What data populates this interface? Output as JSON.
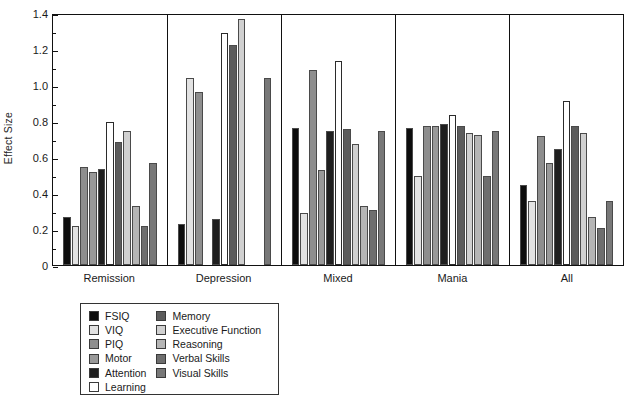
{
  "figure": {
    "background": "#ffffff",
    "axis_color": "#111111"
  },
  "chart_data": {
    "type": "bar",
    "title": "",
    "xlabel": "",
    "ylabel": "Effect Size",
    "ylim": [
      0,
      1.4
    ],
    "ytick_labels": [
      "0",
      "0.2",
      "0.4",
      "0.6",
      "0.8",
      "1.0",
      "1.2",
      "1.4"
    ],
    "ytick_values": [
      0,
      0.2,
      0.4,
      0.6,
      0.8,
      1.0,
      1.2,
      1.4
    ],
    "grid": false,
    "legend_position": "below-left",
    "categories": [
      "Remission",
      "Depression",
      "Mixed",
      "Mania",
      "All"
    ],
    "series": [
      {
        "name": "FSIQ",
        "color": "#0d0d0d",
        "values": [
          0.27,
          0.23,
          0.77,
          0.77,
          0.45
        ]
      },
      {
        "name": "VIQ",
        "color": "#e2e2e2",
        "values": [
          0.22,
          1.05,
          0.29,
          0.5,
          0.36
        ]
      },
      {
        "name": "PIQ",
        "color": "#8e8e8e",
        "values": [
          0.55,
          0.97,
          1.09,
          0.78,
          0.72
        ]
      },
      {
        "name": "Motor",
        "color": "#999999",
        "values": [
          0.52,
          null,
          0.53,
          0.78,
          0.57
        ]
      },
      {
        "name": "Attention",
        "color": "#1f1f1f",
        "values": [
          0.54,
          0.26,
          0.75,
          0.79,
          0.65
        ]
      },
      {
        "name": "Learning",
        "color": "#ffffff",
        "values": [
          0.8,
          1.3,
          1.14,
          0.84,
          0.92
        ]
      },
      {
        "name": "Memory",
        "color": "#5c5c5c",
        "values": [
          0.69,
          1.23,
          0.76,
          0.78,
          0.78
        ]
      },
      {
        "name": "Executive Function",
        "color": "#d0d0d0",
        "values": [
          0.75,
          1.38,
          0.68,
          0.74,
          0.74
        ]
      },
      {
        "name": "Reasoning",
        "color": "#b5b5b5",
        "values": [
          0.33,
          null,
          0.33,
          0.73,
          0.27
        ]
      },
      {
        "name": "Verbal Skills",
        "color": "#6e6e6e",
        "values": [
          0.22,
          null,
          0.31,
          0.5,
          0.21
        ]
      },
      {
        "name": "Visual Skills",
        "color": "#787878",
        "values": [
          0.57,
          1.05,
          0.75,
          0.75,
          0.36
        ]
      }
    ]
  },
  "legend": {
    "columns": [
      [
        "FSIQ",
        "VIQ",
        "PIQ",
        "Motor",
        "Attention",
        "Learning"
      ],
      [
        "Memory",
        "Executive Function",
        "Reasoning",
        "Verbal Skills",
        "Visual Skills"
      ]
    ]
  }
}
